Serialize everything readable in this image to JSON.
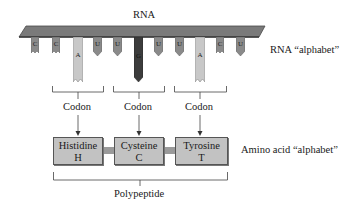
{
  "title": "RNA",
  "rna": {
    "label": "RNA",
    "alphabet_label": "RNA “alphabet”",
    "bar_color": "#7a7a7a",
    "bases": [
      {
        "letter": "C",
        "type": "short-notch",
        "color": "#8a8a8a",
        "x": 31
      },
      {
        "letter": "C",
        "type": "short-notch",
        "color": "#8a8a8a",
        "x": 52
      },
      {
        "letter": "A",
        "type": "long-notch",
        "color": "#c8c8c8",
        "x": 73
      },
      {
        "letter": "U",
        "type": "short-point",
        "color": "#8a8a8a",
        "x": 93
      },
      {
        "letter": "U",
        "type": "short-point",
        "color": "#8a8a8a",
        "x": 113
      },
      {
        "letter": "G",
        "type": "long-point",
        "color": "#3c3c3c",
        "x": 134
      },
      {
        "letter": "U",
        "type": "short-point",
        "color": "#8a8a8a",
        "x": 154
      },
      {
        "letter": "U",
        "type": "short-point",
        "color": "#8a8a8a",
        "x": 175
      },
      {
        "letter": "A",
        "type": "long-notch",
        "color": "#c8c8c8",
        "x": 195
      },
      {
        "letter": "C",
        "type": "short-notch",
        "color": "#8a8a8a",
        "x": 216
      },
      {
        "letter": "U",
        "type": "short-point",
        "color": "#8a8a8a",
        "x": 236
      }
    ]
  },
  "codons": [
    {
      "label": "Codon"
    },
    {
      "label": "Codon"
    },
    {
      "label": "Codon"
    }
  ],
  "amino_acids": {
    "alphabet_label": "Amino acid “alphabet”",
    "items": [
      {
        "name": "Histidine",
        "code": "H"
      },
      {
        "name": "Cysteine",
        "code": "C"
      },
      {
        "name": "Tyrosine",
        "code": "T"
      }
    ],
    "box_color": "#c2c2c2"
  },
  "polypeptide": {
    "label": "Polypeptide"
  }
}
